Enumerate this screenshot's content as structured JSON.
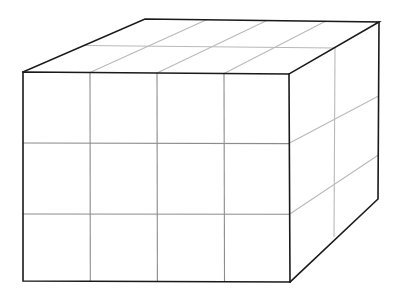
{
  "figure": {
    "title": "",
    "kind": "cuboid-grid-3d",
    "background_color": "#ffffff",
    "edge_color": "#1a1a1a",
    "grid_color": "#b9b9b9",
    "front_grid_color": "#8c8c8c",
    "counts": {
      "columns_width": 4,
      "rows_height": 3,
      "layers_depth": 2,
      "total_cells": 24
    },
    "vertices": {
      "front_top_left": {
        "x": 23,
        "y": 72
      },
      "front_top_right": {
        "x": 289,
        "y": 74
      },
      "front_bottom_right": {
        "x": 290,
        "y": 282
      },
      "front_bottom_left": {
        "x": 23,
        "y": 281
      },
      "back_top_left": {
        "x": 145,
        "y": 19
      },
      "back_top_right": {
        "x": 379,
        "y": 22
      },
      "back_bottom_right": {
        "x": 378,
        "y": 199
      }
    },
    "front_face": {
      "vertical_gridline_x": [
        90,
        157,
        224
      ],
      "horizontal_gridline_y": [
        143,
        214
      ]
    },
    "top_face": {
      "depth_gridline_count": 1,
      "column_gridline_count": 3
    },
    "right_face": {
      "vertical_gridline_x": 335,
      "horizontal_gridline_count": 2
    }
  }
}
